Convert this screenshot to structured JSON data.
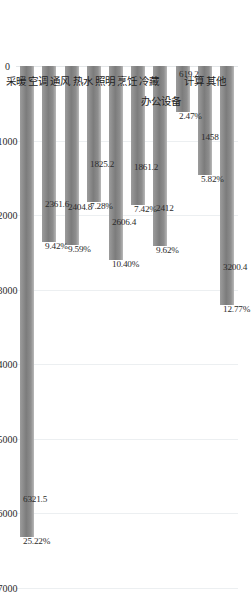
{
  "chart_data": {
    "type": "bar",
    "title": "",
    "subtitle": "",
    "xlabel": "",
    "ylabel": "",
    "orientation": "vertical-rotated",
    "grid": true,
    "legend": null,
    "ylim": [
      0,
      7000
    ],
    "ticks": [
      "0",
      "1000",
      "2000",
      "3000",
      "4000",
      "5000",
      "6000",
      "7000"
    ],
    "tick_values": [
      0,
      1000,
      2000,
      3000,
      4000,
      5000,
      6000,
      7000
    ],
    "categories": [
      "其他",
      "计算",
      "办公设备",
      "冷藏",
      "烹饪",
      "照明",
      "热水",
      "通风",
      "空调",
      "采暖"
    ],
    "values": [
      3200.4,
      1458,
      619.2,
      2412,
      1861.2,
      2606.4,
      1825.2,
      2404.8,
      2361.6,
      6321.5
    ],
    "value_labels": [
      "3200.4",
      "1458",
      "619.2",
      "2412",
      "1861.2",
      "2606.4",
      "1825.2",
      "2404.8",
      "2361.6",
      "6321.5"
    ],
    "percent_labels": [
      "12.77%",
      "5.82%",
      "2.47%",
      "9.62%",
      "7.42%",
      "10.40%",
      "7.28%",
      "9.59%",
      "9.42%",
      "25.22%"
    ],
    "percents": [
      12.77,
      5.82,
      2.47,
      9.62,
      7.42,
      10.4,
      7.28,
      9.59,
      9.42,
      25.22
    ],
    "bar_color": "#8e8e8e",
    "gridline_color": "#eceff1"
  }
}
